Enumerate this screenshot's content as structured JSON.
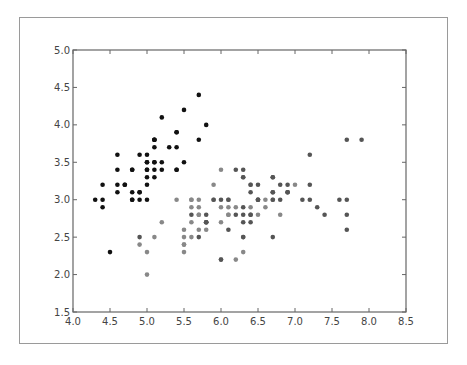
{
  "chart_data": {
    "type": "scatter",
    "title": "",
    "xlabel": "",
    "ylabel": "",
    "xlim": [
      4.0,
      8.5
    ],
    "ylim": [
      1.5,
      5.0
    ],
    "grid": false,
    "legend": null,
    "x_ticks": [
      "4.0",
      "4.5",
      "5.0",
      "5.5",
      "6.0",
      "6.5",
      "7.0",
      "7.5",
      "8.0",
      "8.5"
    ],
    "y_ticks": [
      "1.5",
      "2.0",
      "2.5",
      "3.0",
      "3.5",
      "4.0",
      "4.5",
      "5.0"
    ],
    "series": [
      {
        "name": "setosa",
        "color": "#111111",
        "points": [
          [
            5.1,
            3.5
          ],
          [
            4.9,
            3.0
          ],
          [
            4.7,
            3.2
          ],
          [
            4.6,
            3.1
          ],
          [
            5.0,
            3.6
          ],
          [
            5.4,
            3.9
          ],
          [
            4.6,
            3.4
          ],
          [
            5.0,
            3.4
          ],
          [
            4.4,
            2.9
          ],
          [
            4.9,
            3.1
          ],
          [
            5.4,
            3.7
          ],
          [
            4.8,
            3.4
          ],
          [
            4.8,
            3.0
          ],
          [
            4.3,
            3.0
          ],
          [
            5.8,
            4.0
          ],
          [
            5.7,
            4.4
          ],
          [
            5.4,
            3.9
          ],
          [
            5.1,
            3.5
          ],
          [
            5.7,
            3.8
          ],
          [
            5.1,
            3.8
          ],
          [
            5.4,
            3.4
          ],
          [
            5.1,
            3.7
          ],
          [
            4.6,
            3.6
          ],
          [
            5.1,
            3.3
          ],
          [
            4.8,
            3.4
          ],
          [
            5.0,
            3.0
          ],
          [
            5.0,
            3.4
          ],
          [
            5.2,
            3.5
          ],
          [
            5.2,
            3.4
          ],
          [
            4.7,
            3.2
          ],
          [
            4.8,
            3.1
          ],
          [
            5.4,
            3.4
          ],
          [
            5.2,
            4.1
          ],
          [
            5.5,
            4.2
          ],
          [
            4.9,
            3.1
          ],
          [
            5.0,
            3.2
          ],
          [
            5.5,
            3.5
          ],
          [
            4.9,
            3.6
          ],
          [
            4.4,
            3.0
          ],
          [
            5.1,
            3.4
          ],
          [
            5.0,
            3.5
          ],
          [
            4.5,
            2.3
          ],
          [
            4.4,
            3.2
          ],
          [
            5.0,
            3.5
          ],
          [
            5.1,
            3.8
          ],
          [
            4.8,
            3.0
          ],
          [
            5.1,
            3.8
          ],
          [
            4.6,
            3.2
          ],
          [
            5.3,
            3.7
          ],
          [
            5.0,
            3.3
          ]
        ]
      },
      {
        "name": "versicolor",
        "color": "#888888",
        "points": [
          [
            7.0,
            3.2
          ],
          [
            6.4,
            3.2
          ],
          [
            6.9,
            3.1
          ],
          [
            5.5,
            2.3
          ],
          [
            6.5,
            2.8
          ],
          [
            5.7,
            2.8
          ],
          [
            6.3,
            3.3
          ],
          [
            4.9,
            2.4
          ],
          [
            6.6,
            2.9
          ],
          [
            5.2,
            2.7
          ],
          [
            5.0,
            2.0
          ],
          [
            5.9,
            3.0
          ],
          [
            6.0,
            2.2
          ],
          [
            6.1,
            2.9
          ],
          [
            5.6,
            2.9
          ],
          [
            6.7,
            3.1
          ],
          [
            5.6,
            3.0
          ],
          [
            5.8,
            2.7
          ],
          [
            6.2,
            2.2
          ],
          [
            5.6,
            2.5
          ],
          [
            5.9,
            3.2
          ],
          [
            6.1,
            2.8
          ],
          [
            6.3,
            2.5
          ],
          [
            6.1,
            2.8
          ],
          [
            6.4,
            2.9
          ],
          [
            6.6,
            3.0
          ],
          [
            6.8,
            2.8
          ],
          [
            6.7,
            3.0
          ],
          [
            6.0,
            2.9
          ],
          [
            5.7,
            2.6
          ],
          [
            5.5,
            2.4
          ],
          [
            5.5,
            2.4
          ],
          [
            5.8,
            2.7
          ],
          [
            6.0,
            2.7
          ],
          [
            5.4,
            3.0
          ],
          [
            6.0,
            3.4
          ],
          [
            6.7,
            3.1
          ],
          [
            6.3,
            2.3
          ],
          [
            5.6,
            3.0
          ],
          [
            5.5,
            2.5
          ],
          [
            5.5,
            2.6
          ],
          [
            6.1,
            3.0
          ],
          [
            5.8,
            2.6
          ],
          [
            5.0,
            2.3
          ],
          [
            5.6,
            2.7
          ],
          [
            5.7,
            3.0
          ],
          [
            5.7,
            2.9
          ],
          [
            6.2,
            2.9
          ],
          [
            5.1,
            2.5
          ],
          [
            5.7,
            2.8
          ]
        ]
      },
      {
        "name": "virginica",
        "color": "#555555",
        "points": [
          [
            6.3,
            3.3
          ],
          [
            5.8,
            2.7
          ],
          [
            7.1,
            3.0
          ],
          [
            6.3,
            2.9
          ],
          [
            6.5,
            3.0
          ],
          [
            7.6,
            3.0
          ],
          [
            4.9,
            2.5
          ],
          [
            7.3,
            2.9
          ],
          [
            6.7,
            2.5
          ],
          [
            7.2,
            3.6
          ],
          [
            6.5,
            3.2
          ],
          [
            6.4,
            2.7
          ],
          [
            6.8,
            3.0
          ],
          [
            5.7,
            2.5
          ],
          [
            5.8,
            2.8
          ],
          [
            6.4,
            3.2
          ],
          [
            6.5,
            3.0
          ],
          [
            7.7,
            3.8
          ],
          [
            7.7,
            2.6
          ],
          [
            6.0,
            2.2
          ],
          [
            6.9,
            3.2
          ],
          [
            5.6,
            2.8
          ],
          [
            7.7,
            2.8
          ],
          [
            6.3,
            2.7
          ],
          [
            6.7,
            3.3
          ],
          [
            7.2,
            3.2
          ],
          [
            6.2,
            2.8
          ],
          [
            6.1,
            3.0
          ],
          [
            6.4,
            2.8
          ],
          [
            7.2,
            3.0
          ],
          [
            7.4,
            2.8
          ],
          [
            7.9,
            3.8
          ],
          [
            6.4,
            2.8
          ],
          [
            6.3,
            2.8
          ],
          [
            6.1,
            2.6
          ],
          [
            7.7,
            3.0
          ],
          [
            6.3,
            3.4
          ],
          [
            6.4,
            3.1
          ],
          [
            6.0,
            3.0
          ],
          [
            6.9,
            3.1
          ],
          [
            6.7,
            3.1
          ],
          [
            6.9,
            3.1
          ],
          [
            5.8,
            2.7
          ],
          [
            6.8,
            3.2
          ],
          [
            6.7,
            3.3
          ],
          [
            6.7,
            3.0
          ],
          [
            6.3,
            2.5
          ],
          [
            6.5,
            3.0
          ],
          [
            6.2,
            3.4
          ],
          [
            5.9,
            3.0
          ]
        ]
      }
    ]
  },
  "plot": {
    "left": 73,
    "top": 50,
    "right": 406,
    "bottom": 312,
    "frame_color": "#666666",
    "marker_radius": 2.3
  }
}
